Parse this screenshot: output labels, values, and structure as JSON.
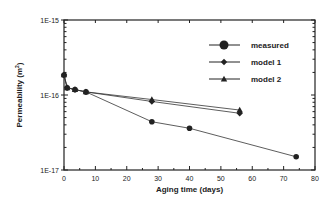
{
  "chart_data": {
    "type": "line",
    "title": "",
    "xlabel": "Aging time (days)",
    "ylabel": "Permeability (m2)",
    "xlim": [
      0,
      80
    ],
    "ylim": [
      1e-17,
      1e-15
    ],
    "yscale": "log",
    "x_ticks": [
      "0",
      "10",
      "20",
      "30",
      "40",
      "50",
      "60",
      "70",
      "80"
    ],
    "y_ticks": [
      "1E-17",
      "1E-16",
      "1E-15"
    ],
    "grid": false,
    "legend_position": "upper right",
    "series": [
      {
        "name": "measured",
        "marker": "circle",
        "x": [
          0,
          1,
          3.5,
          7,
          28,
          40,
          74
        ],
        "y": [
          1.85e-16,
          1.25e-16,
          1.18e-16,
          1.1e-16,
          4.4e-17,
          3.6e-17,
          1.5e-17
        ]
      },
      {
        "name": "model 1",
        "marker": "diamond",
        "x": [
          0,
          1,
          3.5,
          7,
          28,
          56
        ],
        "y": [
          1.85e-16,
          1.25e-16,
          1.18e-16,
          1.1e-16,
          8.2e-17,
          5.7e-17
        ]
      },
      {
        "name": "model 2",
        "marker": "triangle",
        "x": [
          0,
          1,
          3.5,
          7,
          28,
          56
        ],
        "y": [
          1.85e-16,
          1.25e-16,
          1.18e-16,
          1.1e-16,
          8.7e-17,
          6.3e-17
        ]
      }
    ]
  },
  "legend": {
    "measured": "measured",
    "model1": "model  1",
    "model2": "model  2"
  },
  "axes": {
    "xlabel": "Aging time (days)",
    "ylabel": "Permeability (m2)"
  }
}
